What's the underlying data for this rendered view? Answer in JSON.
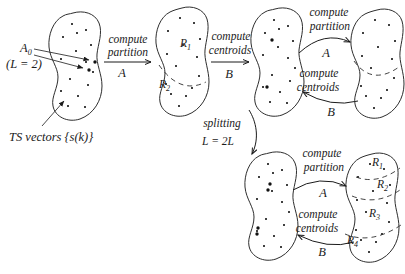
{
  "figure": {
    "background": "#ffffff",
    "ink_color": "#1b1b1b",
    "outline_color": "#2e2e2e",
    "training_dot_color": "#b3ab9f",
    "centroid_dot_color": "#111111",
    "initial_codebook": {
      "name_main": "A",
      "name_sub": "0",
      "size_note": "(L = 2)"
    },
    "training_set_label": "TS vectors {s(k)}",
    "operations": {
      "partition": {
        "line1": "compute",
        "line2": "partition",
        "tag": "A"
      },
      "centroids": {
        "line1": "compute",
        "line2": "centroids",
        "tag": "B"
      },
      "splitting": {
        "line1": "splitting",
        "line2": "L = 2L"
      }
    },
    "two_region_labels": [
      {
        "main": "R",
        "sub": "1"
      },
      {
        "main": "R",
        "sub": "2"
      }
    ],
    "four_region_labels": [
      {
        "main": "R",
        "sub": "1"
      },
      {
        "main": "R",
        "sub": "2"
      },
      {
        "main": "R",
        "sub": "3"
      },
      {
        "main": "R",
        "sub": "4"
      }
    ]
  }
}
